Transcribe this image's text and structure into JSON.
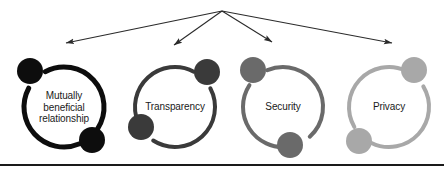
{
  "figure": {
    "type": "hub-and-spoke ring diagram",
    "background_color": "#ffffff",
    "width": 444,
    "height": 173,
    "hub": {
      "x": 222,
      "y": 11
    },
    "arrow_color": "#2b2b2b",
    "bottom_rule": {
      "y": 164,
      "height": 2,
      "color": "#1a1a1a",
      "width": 444
    }
  },
  "nodes": [
    {
      "id": "mutually-beneficial-relationship",
      "label": "Mutually\nbeneficial\nrelationship",
      "label_lines": [
        "Mutually",
        "beneficial",
        "relationship"
      ],
      "color": "#0d0d0d",
      "center": {
        "x": 64,
        "y": 107
      },
      "radius": 40,
      "stroke_width": 5,
      "dots": [
        {
          "position": "top-left",
          "angle": -135,
          "cx": 30,
          "cy": 71,
          "r": 13
        },
        {
          "position": "bottom-right",
          "angle": 50,
          "cx": 92,
          "cy": 140,
          "r": 13
        }
      ],
      "arrow_target": {
        "x": 66,
        "y": 43
      }
    },
    {
      "id": "transparency",
      "label": "Transparency",
      "label_lines": [
        "Transparency"
      ],
      "color": "#3a3a3a",
      "center": {
        "x": 175,
        "y": 107
      },
      "radius": 40,
      "stroke_width": 4,
      "dots": [
        {
          "position": "top-right",
          "angle": -45,
          "cx": 207,
          "cy": 72,
          "r": 13
        },
        {
          "position": "bottom-left",
          "angle": 140,
          "cx": 141,
          "cy": 127,
          "r": 13
        }
      ],
      "arrow_target": {
        "x": 174,
        "y": 45
      }
    },
    {
      "id": "security",
      "label": "Security",
      "label_lines": [
        "Security"
      ],
      "color": "#6a6a6a",
      "center": {
        "x": 283,
        "y": 107
      },
      "radius": 40,
      "stroke_width": 4,
      "dots": [
        {
          "position": "top-left",
          "angle": -130,
          "cx": 253,
          "cy": 70,
          "r": 13
        },
        {
          "position": "bottom-right",
          "angle": 65,
          "cx": 290,
          "cy": 145,
          "r": 13
        }
      ],
      "arrow_target": {
        "x": 272,
        "y": 42
      }
    },
    {
      "id": "privacy",
      "label": "Privacy",
      "label_lines": [
        "Privacy"
      ],
      "color": "#a8a8a8",
      "center": {
        "x": 389,
        "y": 107
      },
      "radius": 40,
      "stroke_width": 4,
      "dots": [
        {
          "position": "top-right",
          "angle": -48,
          "cx": 414,
          "cy": 70,
          "r": 13
        },
        {
          "position": "bottom-left",
          "angle": 133,
          "cx": 359,
          "cy": 141,
          "r": 13
        }
      ],
      "arrow_target": {
        "x": 392,
        "y": 43
      }
    }
  ]
}
